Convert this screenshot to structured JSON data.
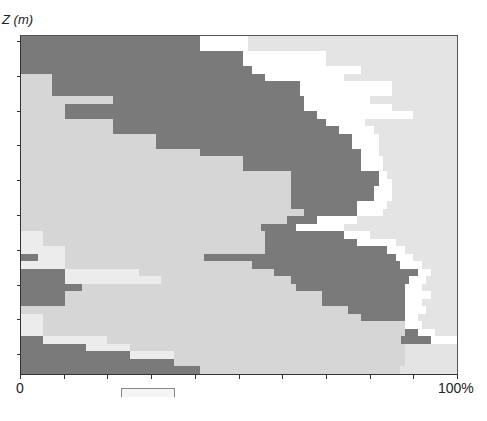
{
  "chart_data": {
    "type": "area",
    "title": "",
    "ylabel": "Z (m)",
    "xlabel": "",
    "x_tick_labels": [
      "0",
      "100%"
    ],
    "xlim": [
      0,
      100
    ],
    "x_ticks_every_percent": 10,
    "y_tick_count": 10,
    "colors": {
      "dark": "#7a7a7a",
      "light": "#d6d6d6",
      "pale": "#ececec",
      "white": "#ffffff",
      "faint": "#e4e4e4"
    },
    "rows_top_to_bottom": [
      [
        [
          "dark",
          41
        ],
        [
          "white",
          11
        ],
        [
          "faint",
          48
        ]
      ],
      [
        [
          "dark",
          41
        ],
        [
          "white",
          11
        ],
        [
          "faint",
          48
        ]
      ],
      [
        [
          "dark",
          51
        ],
        [
          "white",
          19
        ],
        [
          "faint",
          30
        ]
      ],
      [
        [
          "dark",
          51
        ],
        [
          "white",
          19
        ],
        [
          "faint",
          30
        ]
      ],
      [
        [
          "dark",
          53
        ],
        [
          "white",
          25
        ],
        [
          "faint",
          22
        ]
      ],
      [
        [
          "light",
          7
        ],
        [
          "dark",
          49
        ],
        [
          "white",
          18
        ],
        [
          "faint",
          26
        ]
      ],
      [
        [
          "light",
          7
        ],
        [
          "dark",
          57
        ],
        [
          "white",
          21
        ],
        [
          "faint",
          15
        ]
      ],
      [
        [
          "light",
          7
        ],
        [
          "dark",
          57
        ],
        [
          "white",
          21
        ],
        [
          "faint",
          15
        ]
      ],
      [
        [
          "light",
          21
        ],
        [
          "dark",
          44
        ],
        [
          "white",
          15
        ],
        [
          "faint",
          20
        ]
      ],
      [
        [
          "light",
          10
        ],
        [
          "dark",
          55
        ],
        [
          "white",
          20
        ],
        [
          "faint",
          15
        ]
      ],
      [
        [
          "light",
          10
        ],
        [
          "dark",
          58
        ],
        [
          "white",
          22
        ],
        [
          "faint",
          10
        ]
      ],
      [
        [
          "light",
          21
        ],
        [
          "dark",
          49
        ],
        [
          "white",
          9
        ],
        [
          "faint",
          21
        ]
      ],
      [
        [
          "light",
          21
        ],
        [
          "dark",
          52
        ],
        [
          "white",
          8
        ],
        [
          "faint",
          19
        ]
      ],
      [
        [
          "light",
          31
        ],
        [
          "dark",
          45
        ],
        [
          "white",
          6
        ],
        [
          "faint",
          18
        ]
      ],
      [
        [
          "light",
          31
        ],
        [
          "dark",
          45
        ],
        [
          "white",
          6
        ],
        [
          "faint",
          18
        ]
      ],
      [
        [
          "light",
          41
        ],
        [
          "dark",
          37
        ],
        [
          "white",
          4
        ],
        [
          "faint",
          18
        ]
      ],
      [
        [
          "light",
          51
        ],
        [
          "dark",
          27
        ],
        [
          "white",
          5
        ],
        [
          "faint",
          17
        ]
      ],
      [
        [
          "light",
          51
        ],
        [
          "dark",
          27
        ],
        [
          "white",
          5
        ],
        [
          "faint",
          17
        ]
      ],
      [
        [
          "light",
          62
        ],
        [
          "dark",
          20
        ],
        [
          "white",
          2
        ],
        [
          "faint",
          16
        ]
      ],
      [
        [
          "light",
          62
        ],
        [
          "dark",
          20
        ],
        [
          "white",
          3
        ],
        [
          "faint",
          15
        ]
      ],
      [
        [
          "light",
          62
        ],
        [
          "dark",
          19
        ],
        [
          "white",
          4
        ],
        [
          "faint",
          15
        ]
      ],
      [
        [
          "light",
          62
        ],
        [
          "dark",
          19
        ],
        [
          "white",
          4
        ],
        [
          "faint",
          15
        ]
      ],
      [
        [
          "light",
          62
        ],
        [
          "dark",
          15
        ],
        [
          "white",
          7
        ],
        [
          "faint",
          16
        ]
      ],
      [
        [
          "light",
          65
        ],
        [
          "dark",
          12
        ],
        [
          "white",
          6
        ],
        [
          "faint",
          17
        ]
      ],
      [
        [
          "light",
          61
        ],
        [
          "dark",
          7
        ],
        [
          "white",
          9
        ],
        [
          "faint",
          23
        ]
      ],
      [
        [
          "light",
          55
        ],
        [
          "dark",
          8
        ],
        [
          "white",
          11
        ],
        [
          "faint",
          26
        ]
      ],
      [
        [
          "pale",
          5
        ],
        [
          "light",
          51
        ],
        [
          "dark",
          18
        ],
        [
          "white",
          6
        ],
        [
          "faint",
          20
        ]
      ],
      [
        [
          "pale",
          5
        ],
        [
          "light",
          51
        ],
        [
          "dark",
          21
        ],
        [
          "white",
          9
        ],
        [
          "faint",
          14
        ]
      ],
      [
        [
          "pale",
          10
        ],
        [
          "light",
          46
        ],
        [
          "dark",
          28
        ],
        [
          "white",
          4
        ],
        [
          "faint",
          12
        ]
      ],
      [
        [
          "dark",
          4
        ],
        [
          "pale",
          6
        ],
        [
          "light",
          32
        ],
        [
          "dark",
          44
        ],
        [
          "white",
          4
        ],
        [
          "faint",
          10
        ]
      ],
      [
        [
          "pale",
          10
        ],
        [
          "light",
          43
        ],
        [
          "dark",
          34
        ],
        [
          "white",
          5
        ],
        [
          "faint",
          8
        ]
      ],
      [
        [
          "dark",
          10
        ],
        [
          "pale",
          17
        ],
        [
          "light",
          31
        ],
        [
          "dark",
          33
        ],
        [
          "white",
          3
        ],
        [
          "faint",
          6
        ]
      ],
      [
        [
          "dark",
          10
        ],
        [
          "pale",
          22
        ],
        [
          "light",
          30
        ],
        [
          "dark",
          27
        ],
        [
          "white",
          4
        ],
        [
          "faint",
          7
        ]
      ],
      [
        [
          "dark",
          14
        ],
        [
          "light",
          49
        ],
        [
          "dark",
          25
        ],
        [
          "white",
          4
        ],
        [
          "faint",
          8
        ]
      ],
      [
        [
          "dark",
          10
        ],
        [
          "light",
          59
        ],
        [
          "dark",
          19
        ],
        [
          "white",
          6
        ],
        [
          "faint",
          6
        ]
      ],
      [
        [
          "dark",
          10
        ],
        [
          "light",
          59
        ],
        [
          "dark",
          19
        ],
        [
          "white",
          4
        ],
        [
          "faint",
          8
        ]
      ],
      [
        [
          "light",
          75
        ],
        [
          "dark",
          13
        ],
        [
          "white",
          5
        ],
        [
          "faint",
          7
        ]
      ],
      [
        [
          "pale",
          5
        ],
        [
          "light",
          73
        ],
        [
          "dark",
          10
        ],
        [
          "white",
          3
        ],
        [
          "faint",
          9
        ]
      ],
      [
        [
          "pale",
          5
        ],
        [
          "light",
          83
        ],
        [
          "white",
          4
        ],
        [
          "faint",
          8
        ]
      ],
      [
        [
          "pale",
          5
        ],
        [
          "light",
          83
        ],
        [
          "dark",
          3
        ],
        [
          "white",
          4
        ],
        [
          "faint",
          5
        ]
      ],
      [
        [
          "dark",
          5
        ],
        [
          "pale",
          15
        ],
        [
          "light",
          68
        ],
        [
          "dark",
          7
        ],
        [
          "white",
          6
        ]
      ],
      [
        [
          "dark",
          15
        ],
        [
          "pale",
          10
        ],
        [
          "light",
          63
        ],
        [
          "faint",
          12
        ]
      ],
      [
        [
          "dark",
          25
        ],
        [
          "pale",
          10
        ],
        [
          "light",
          53
        ],
        [
          "faint",
          12
        ]
      ],
      [
        [
          "dark",
          35
        ],
        [
          "light",
          53
        ],
        [
          "faint",
          12
        ]
      ],
      [
        [
          "dark",
          41
        ],
        [
          "light",
          46
        ],
        [
          "faint",
          13
        ]
      ]
    ]
  },
  "axis": {
    "y_label": "Z (m)",
    "x_start": "0",
    "x_end": "100%"
  },
  "edge_text": ""
}
